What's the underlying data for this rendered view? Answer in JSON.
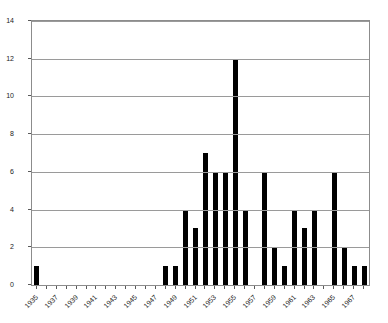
{
  "chart_data": {
    "type": "bar",
    "title": "",
    "subtitle": "",
    "xlabel": "",
    "ylabel": "",
    "grid": true,
    "legend": null,
    "legend_position": "none",
    "bar_color": "#000000",
    "grid_color": "#9a9a9a",
    "axis_color": "#8c8c8c",
    "ylim": [
      0,
      14
    ],
    "yticks": [
      0,
      2,
      4,
      6,
      8,
      10,
      12,
      14
    ],
    "ytick_labels": [
      "0",
      "2",
      "4",
      "6",
      "8",
      "10",
      "12",
      "14"
    ],
    "xtick_labels": [
      "1935",
      "1937",
      "1939",
      "1941",
      "1943",
      "1945",
      "1947",
      "1949",
      "1951",
      "1953",
      "1955",
      "1957",
      "1959",
      "1961",
      "1963",
      "1965",
      "1967"
    ],
    "xtick_step_years": 2,
    "x_start_year": 1935,
    "x_end_year": 1968,
    "categories": [
      "1935",
      "1936",
      "1937",
      "1938",
      "1939",
      "1940",
      "1941",
      "1942",
      "1943",
      "1944",
      "1945",
      "1946",
      "1947",
      "1948",
      "1949",
      "1950",
      "1951",
      "1952",
      "1953",
      "1954",
      "1955",
      "1956",
      "1957",
      "1958",
      "1959",
      "1960",
      "1961",
      "1962",
      "1963",
      "1964",
      "1965",
      "1966",
      "1967",
      "1968"
    ],
    "values": [
      1,
      0,
      0,
      0,
      0,
      0,
      0,
      0,
      0,
      0,
      0,
      0,
      0,
      1,
      1,
      4,
      3,
      7,
      6,
      6,
      12,
      4,
      0,
      6,
      2,
      1,
      4,
      3,
      4,
      0,
      6,
      2,
      1,
      1
    ]
  }
}
